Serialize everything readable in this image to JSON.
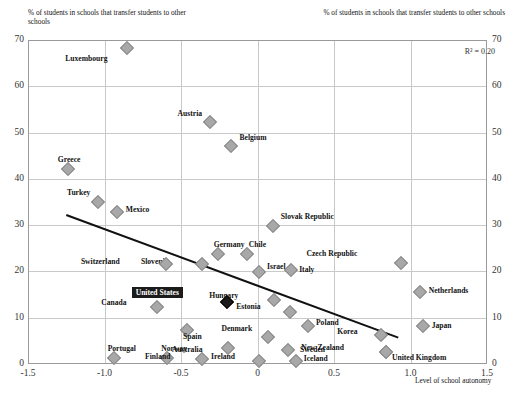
{
  "header": {
    "y_axis_note_left": "% of students in schools that transfer students to other schools",
    "y_axis_note_right": "% of students in schools that transfer students to other schools",
    "r_squared": "R² = 0.20"
  },
  "chart_data": {
    "type": "scatter",
    "title": "",
    "xlabel": "Level of school autonomy",
    "ylabel": "% of students in schools that transfer students to other schools",
    "xlim": [
      -1.5,
      1.5
    ],
    "ylim": [
      0,
      70
    ],
    "xticks": [
      "-1.5",
      "-1.0",
      "-0.5",
      "0",
      "0.5",
      "1.0",
      "1.5"
    ],
    "yticks": [
      "0",
      "10",
      "20",
      "30",
      "40",
      "50",
      "60",
      "70"
    ],
    "grid": true,
    "legend": "none",
    "annotations": [
      "R² = 0.20"
    ],
    "trendline": {
      "x0": -1.25,
      "y0": 32.2,
      "x1": 0.92,
      "y1": 5.7
    },
    "points": [
      {
        "label": "Luxembourg",
        "x": -0.85,
        "y": 68.2,
        "lx": -24,
        "ly": 11
      },
      {
        "label": "Austria",
        "x": -0.31,
        "y": 52.2,
        "lx": -12,
        "ly": -8
      },
      {
        "label": "Belgium",
        "x": -0.17,
        "y": 47.2,
        "lx": 8,
        "ly": -8
      },
      {
        "label": "Greece",
        "x": -1.24,
        "y": 42.2,
        "lx": -10,
        "ly": -9
      },
      {
        "label": "Turkey",
        "x": -1.04,
        "y": 35.0,
        "lx": -12,
        "ly": -9
      },
      {
        "label": "Mexico",
        "x": -0.92,
        "y": 32.8,
        "lx": 9,
        "ly": -2
      },
      {
        "label": "Slovak Republic",
        "x": 0.1,
        "y": 29.8,
        "lx": 8,
        "ly": -9
      },
      {
        "label": "Germany",
        "x": -0.26,
        "y": 23.8,
        "lx": -4,
        "ly": -9
      },
      {
        "label": "Chile",
        "x": -0.07,
        "y": 23.8,
        "lx": 2,
        "ly": -9
      },
      {
        "label": "Israel",
        "x": 0.01,
        "y": 19.9,
        "lx": 8,
        "ly": -5
      },
      {
        "label": "Slovenia",
        "x": -0.36,
        "y": 21.5,
        "lx": -38,
        "ly": -2
      },
      {
        "label": "Switzerland",
        "x": -0.6,
        "y": 21.5,
        "lx": -50,
        "ly": -2
      },
      {
        "label": "Czech Republic",
        "x": 0.94,
        "y": 21.8,
        "lx": -48,
        "ly": -9
      },
      {
        "label": "Italy",
        "x": 0.22,
        "y": 20.4,
        "lx": 8,
        "ly": 0
      },
      {
        "label": "Netherlands",
        "x": 1.06,
        "y": 15.5,
        "lx": 9,
        "ly": -1
      },
      {
        "label": "Canada",
        "x": -0.66,
        "y": 12.4,
        "lx": -34,
        "ly": -4
      },
      {
        "label": "United States",
        "x": -0.2,
        "y": 13.3,
        "lx": -48,
        "ly": -10,
        "boxed": true,
        "highlight": true
      },
      {
        "label": "Hungary",
        "x": 0.11,
        "y": 13.8,
        "lx": -40,
        "ly": -4
      },
      {
        "label": "Estonia",
        "x": 0.21,
        "y": 11.3,
        "lx": -33,
        "ly": -5
      },
      {
        "label": "Poland",
        "x": 0.33,
        "y": 8.3,
        "lx": 8,
        "ly": -3
      },
      {
        "label": "Japan",
        "x": 1.08,
        "y": 8.3,
        "lx": 9,
        "ly": 0
      },
      {
        "label": "Korea",
        "x": 0.81,
        "y": 6.2,
        "lx": -28,
        "ly": -3
      },
      {
        "label": "Spain",
        "x": -0.46,
        "y": 7.4,
        "lx": -4,
        "ly": 7
      },
      {
        "label": "Denmark",
        "x": 0.07,
        "y": 5.9,
        "lx": -20,
        "ly": -8
      },
      {
        "label": "Australia",
        "x": -0.19,
        "y": 3.5,
        "lx": -30,
        "ly": 2
      },
      {
        "label": "Sweden",
        "x": 0.2,
        "y": 3.0,
        "lx": 12,
        "ly": 0
      },
      {
        "label": "New Zealand",
        "x": 0.84,
        "y": 2.6,
        "lx": -46,
        "ly": -4
      },
      {
        "label": "United Kingdom",
        "x": 0.84,
        "y": 2.6,
        "lx": 6,
        "ly": 6
      },
      {
        "label": "Portugal",
        "x": -0.94,
        "y": 1.4,
        "lx": -6,
        "ly": -9
      },
      {
        "label": "Norway",
        "x": -0.59,
        "y": 1.4,
        "lx": -6,
        "ly": -9
      },
      {
        "label": "Finland",
        "x": -0.36,
        "y": 1.0,
        "lx": -36,
        "ly": -2
      },
      {
        "label": "Ireland",
        "x": 0.01,
        "y": 0.6,
        "lx": -28,
        "ly": -4
      },
      {
        "label": "Iceland",
        "x": 0.25,
        "y": 0.6,
        "lx": 8,
        "ly": -2
      }
    ]
  }
}
